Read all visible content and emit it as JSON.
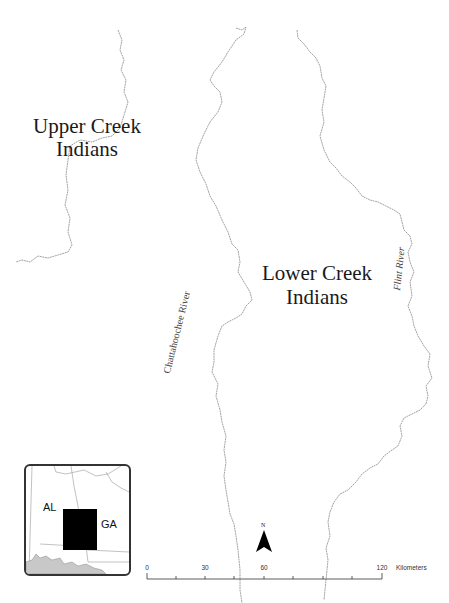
{
  "map": {
    "region_labels": {
      "upper_line1": "Upper Creek",
      "upper_line2": "Indians",
      "lower_line1": "Lower Creek",
      "lower_line2": "Indians"
    },
    "river_labels": {
      "chattahoochee": "Chattahoochee River",
      "flint": "Flint River"
    },
    "colors": {
      "river": "#8c8c8c",
      "text": "#1a1a1a",
      "inset_border": "#333333",
      "inset_water": "#c8c8c8",
      "study_area": "#000000"
    }
  },
  "inset_map": {
    "labels": {
      "left_state": "AL",
      "right_state": "GA"
    }
  },
  "north_arrow": {
    "label": "N"
  },
  "scale_bar": {
    "ticks": [
      "0",
      "30",
      "60",
      "120"
    ],
    "units": "Kilometers"
  }
}
